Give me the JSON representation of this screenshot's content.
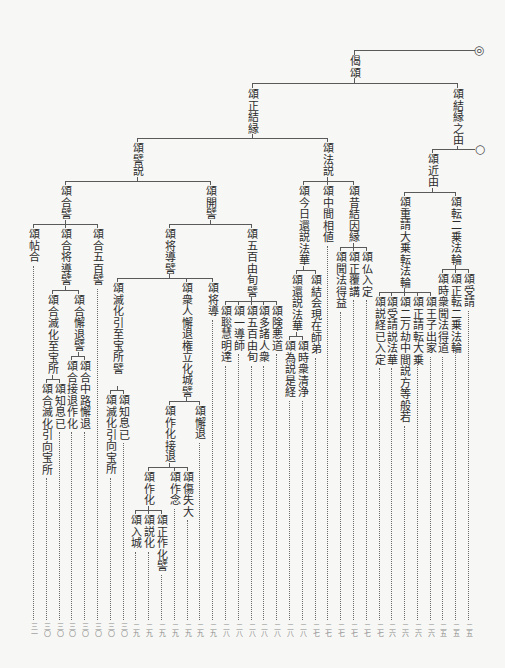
{
  "tree": {
    "label": "偈頌",
    "marker": "◎",
    "children": [
      {
        "label": "頌結縁之由",
        "marker": "○",
        "children": [
          {
            "label": "頌近由",
            "children": [
              {
                "label": "頌転二乗法輪",
                "children": [
                  {
                    "label": "頌受請",
                    "page": "二五"
                  },
                  {
                    "label": "頌正転二乗法輪",
                    "page": "二五"
                  },
                  {
                    "label": "頌時衆聞法得道",
                    "page": "二五"
                  }
                ]
              },
              {
                "label": "頌重請大乗転法輪",
                "children": [
                  {
                    "label": "頌王子出家",
                    "page": "二六"
                  },
                  {
                    "label": "頌正請転大乗",
                    "page": "二六"
                  },
                  {
                    "label": "頌二万劫中間説方等般若",
                    "page": "二六"
                  },
                  {
                    "label": "頌受請説法華",
                    "page": "二六"
                  },
                  {
                    "label": "頌説経已入定",
                    "page": "二七"
                  }
                ]
              }
            ]
          }
        ]
      },
      {
        "label": "頌正結縁",
        "children": [
          {
            "label": "頌法説",
            "children": [
              {
                "label": "頌昔結因縁",
                "children": [
                  {
                    "label": "頌仏入定",
                    "page": "二七"
                  },
                  {
                    "label": "頌正覆講",
                    "page": "二七"
                  },
                  {
                    "label": "頌聞法得益",
                    "page": "二七"
                  }
                ]
              },
              {
                "label": "頌中間相値",
                "page": "二七"
              },
              {
                "label": "頌今日還説法華",
                "children": [
                  {
                    "label": "頌結会現在師弟",
                    "page": "二七"
                  },
                  {
                    "label": "頌還説法華",
                    "children": [
                      {
                        "label": "頌時衆清浄",
                        "page": "二八"
                      },
                      {
                        "label": "頌為説是経",
                        "page": "二八"
                      }
                    ]
                  }
                ]
              }
            ]
          },
          {
            "label": "頌譬説",
            "children": [
              {
                "label": "頌開譬",
                "children": [
                  {
                    "label": "頌五百由旬譬",
                    "children": [
                      {
                        "label": "頌険悪道",
                        "page": "二八"
                      },
                      {
                        "label": "頌多諸人衆",
                        "page": "二八"
                      },
                      {
                        "label": "頌五百由旬",
                        "page": "二八"
                      },
                      {
                        "label": "頌一導師",
                        "page": "二八"
                      },
                      {
                        "label": "頌聡慧明達",
                        "page": "二八"
                      }
                    ]
                  },
                  {
                    "label": "頌将導譬",
                    "children": [
                      {
                        "label": "頌将導",
                        "page": "二九"
                      },
                      {
                        "label": "頌衆人懈退権立化城譬",
                        "children": [
                          {
                            "label": "頌懈退",
                            "page": "二九"
                          },
                          {
                            "label": "頌作化接退",
                            "children": [
                              {
                                "label": "頌傷失大",
                                "page": "二九"
                              },
                              {
                                "label": "頌作念",
                                "page": "二九"
                              },
                              {
                                "label": "頌作化",
                                "children": [
                                  {
                                    "label": "頌正作化譬",
                                    "page": "二九"
                                  },
                                  {
                                    "label": "頌説化",
                                    "page": "二九"
                                  },
                                  {
                                    "label": "頌入城",
                                    "page": "二九"
                                  }
                                ]
                              }
                            ]
                          }
                        ]
                      },
                      {
                        "label": "頌滅化引至宝所譬",
                        "children": [
                          {
                            "label": "頌知息已",
                            "page": "三〇"
                          },
                          {
                            "label": "頌滅化引向宝所",
                            "page": "三〇"
                          }
                        ]
                      }
                    ]
                  }
                ]
              },
              {
                "label": "頌合譬",
                "children": [
                  {
                    "label": "頌合五百譬",
                    "page": "三〇"
                  },
                  {
                    "label": "頌合将導譬",
                    "children": [
                      {
                        "label": "頌合懈退譬",
                        "children": [
                          {
                            "label": "頌合中路懈退",
                            "page": "三〇"
                          },
                          {
                            "label": "頌合接退作化",
                            "page": "三〇"
                          }
                        ]
                      },
                      {
                        "label": "頌合滅化至宝所",
                        "children": [
                          {
                            "label": "頌知息已",
                            "page": "三〇"
                          },
                          {
                            "label": "頌合滅化引向宝所",
                            "page": "三〇"
                          }
                        ]
                      }
                    ]
                  },
                  {
                    "label": "頌帖合",
                    "page": "三一"
                  }
                ]
              }
            ]
          }
        ]
      }
    ]
  }
}
